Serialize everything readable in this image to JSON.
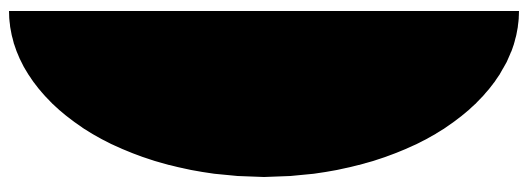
{
  "canvas": {
    "width": 527,
    "height": 194,
    "background_color": "#ffffff",
    "description": "Solid black lower-half-ellipse silhouette on a plain white background"
  },
  "shape": {
    "name": "half-ellipse",
    "fill_color": "#000000",
    "stroke_color": "none",
    "center_x": 264,
    "center_y": 11,
    "radius_x": 255,
    "radius_y": 166,
    "chord_y": 11,
    "chord_left_x": 9,
    "chord_right_x": 519,
    "bottom_y": 177,
    "orientation": "lower-half",
    "path": "M 9 11 A 255 166 0 0 0 519 11 Z"
  },
  "text": {
    "labels": []
  }
}
